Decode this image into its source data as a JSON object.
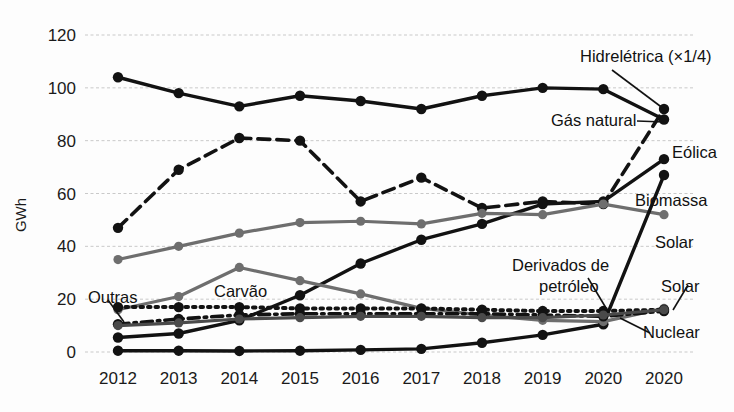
{
  "chart_data": {
    "type": "line",
    "title": "",
    "xlabel": "",
    "ylabel": "GWh",
    "ylim": [
      0,
      120
    ],
    "yticks": [
      0,
      20,
      40,
      60,
      80,
      100,
      120
    ],
    "grid": true,
    "legend_position": "inline-annotations",
    "categories": [
      "2012",
      "2013",
      "2014",
      "2015",
      "2016",
      "2017",
      "2018",
      "2019",
      "2020",
      "2020"
    ],
    "series": [
      {
        "name": "Hidrelétrica (×1/4)",
        "style": "solid-black",
        "color": "#121212",
        "values": [
          104,
          98,
          93,
          97,
          95,
          92,
          97,
          100,
          99.5,
          88
        ]
      },
      {
        "name": "Gás natural",
        "style": "dashed-black",
        "color": "#121212",
        "values": [
          47,
          69,
          81,
          80,
          57,
          66,
          54.5,
          57,
          56,
          92
        ]
      },
      {
        "name": "Eólica",
        "style": "solid-black",
        "color": "#121212",
        "values": [
          5.5,
          7,
          12,
          21.5,
          33.5,
          42.5,
          48.5,
          56,
          57,
          73
        ]
      },
      {
        "name": "Biomassa",
        "style": "solid-gray",
        "color": "#6e6e6e",
        "values": [
          35,
          40,
          45,
          49,
          49.5,
          48.5,
          52.5,
          52,
          56,
          52
        ]
      },
      {
        "name": "Solar",
        "style": "solid-black",
        "color": "#121212",
        "values": [
          0.5,
          0.5,
          0.4,
          0.5,
          0.8,
          1.2,
          3.5,
          6.5,
          10.5,
          67
        ]
      },
      {
        "name": "Carvão",
        "style": "solid-gray",
        "color": "#6e6e6e",
        "values": [
          16,
          21,
          32,
          27,
          22,
          16.5,
          14,
          12,
          11.5,
          16.5
        ]
      },
      {
        "name": "Derivados de petróleo",
        "style": "dotted-black",
        "color": "#121212",
        "values": [
          17,
          17,
          17,
          16.5,
          16.5,
          16.5,
          16,
          15.5,
          15.5,
          16
        ]
      },
      {
        "name": "Nuclear",
        "style": "dashdot-black",
        "color": "#121212",
        "values": [
          10.5,
          12.5,
          14,
          14.5,
          14.5,
          14.5,
          14.5,
          14,
          13.5,
          15.5
        ]
      },
      {
        "name": "Outras",
        "style": "solid-darkgray",
        "color": "#4a4a4a",
        "values": [
          10,
          11,
          12.5,
          13,
          13.5,
          13.5,
          13,
          13,
          14,
          16
        ]
      }
    ],
    "annotations": [
      {
        "text": "Hidrelétrica (×1/4)",
        "x": 580,
        "y": 62,
        "anchor": "start"
      },
      {
        "text": "Gás natural",
        "x": 551,
        "y": 126,
        "anchor": "start"
      },
      {
        "text": "Eólica",
        "x": 672,
        "y": 158,
        "anchor": "start"
      },
      {
        "text": "Biomassa",
        "x": 635,
        "y": 206,
        "anchor": "start"
      },
      {
        "text": "Solar",
        "x": 655,
        "y": 248,
        "anchor": "start"
      },
      {
        "text": "Derivados de",
        "x": 512,
        "y": 271,
        "anchor": "start"
      },
      {
        "text": "petróleo",
        "x": 539,
        "y": 292,
        "anchor": "start"
      },
      {
        "text": "Solar",
        "x": 661,
        "y": 292,
        "anchor": "start"
      },
      {
        "text": "Nuclear",
        "x": 643,
        "y": 338,
        "anchor": "start"
      },
      {
        "text": "Outras",
        "x": 88,
        "y": 303,
        "anchor": "start"
      },
      {
        "text": "Carvão",
        "x": 214,
        "y": 297,
        "anchor": "start"
      }
    ]
  },
  "axes": {
    "y_axis_title": "GWh",
    "y_tick_labels": [
      "120",
      "100",
      "80",
      "60",
      "40",
      "20",
      "0"
    ],
    "x_tick_labels": [
      "2012",
      "2013",
      "2014",
      "2015",
      "2016",
      "2017",
      "2018",
      "2019",
      "2020",
      "2020"
    ]
  },
  "colors": {
    "black": "#121212",
    "gray": "#6e6e6e",
    "darkgray": "#4a4a4a",
    "grid": "#c9c9c9",
    "background": "#fdfdfd"
  }
}
